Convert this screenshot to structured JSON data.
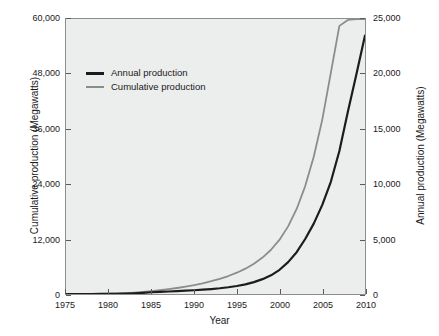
{
  "chart_data": {
    "type": "line",
    "title": "",
    "subtitle": "",
    "xlabel": "Year",
    "ylabel": "Cumulative production (Megawatts)",
    "ylabel_right": "Annual production (Megawatts)",
    "xlim": [
      1975,
      2010
    ],
    "ylim": [
      0,
      60000
    ],
    "ylim_right": [
      0,
      25000
    ],
    "grid": false,
    "legend_position": "top-left",
    "xticks": [
      "1975",
      "1980",
      "1985",
      "1990",
      "1995",
      "2000",
      "2005",
      "2010"
    ],
    "xtick_values": [
      1975,
      1980,
      1985,
      1990,
      1995,
      2000,
      2005,
      2010
    ],
    "yticks_left": [
      "0",
      "12,000",
      "24,000",
      "36,000",
      "48,000",
      "60,000"
    ],
    "ytick_left_values": [
      0,
      12000,
      24000,
      36000,
      48000,
      60000
    ],
    "yticks_right": [
      "0",
      "5,000",
      "10,000",
      "15,000",
      "20,000",
      "25,000"
    ],
    "ytick_right_values": [
      0,
      5000,
      10000,
      15000,
      20000,
      25000
    ],
    "x": [
      1975,
      1976,
      1977,
      1978,
      1979,
      1980,
      1981,
      1982,
      1983,
      1984,
      1985,
      1986,
      1987,
      1988,
      1989,
      1990,
      1991,
      1992,
      1993,
      1994,
      1995,
      1996,
      1997,
      1998,
      1999,
      2000,
      2001,
      2002,
      2003,
      2004,
      2005,
      2006,
      2007,
      2008,
      2009,
      2010
    ],
    "series": [
      {
        "name": "Annual production",
        "axis": "right",
        "color": "#1c1c1c",
        "linewidth": 2.2,
        "values": [
          0,
          0,
          0,
          0,
          5,
          10,
          20,
          40,
          70,
          110,
          160,
          200,
          230,
          260,
          300,
          340,
          390,
          450,
          520,
          610,
          730,
          880,
          1080,
          1350,
          1700,
          2200,
          2900,
          3800,
          5000,
          6400,
          8100,
          10200,
          13000,
          16600,
          20000,
          23500
        ]
      },
      {
        "name": "Cumulative production",
        "axis": "left",
        "color": "#8c8c8c",
        "linewidth": 1.8,
        "values": [
          0,
          0,
          5,
          15,
          35,
          70,
          120,
          200,
          310,
          450,
          620,
          820,
          1050,
          1310,
          1610,
          1950,
          2340,
          2790,
          3310,
          3920,
          4650,
          5530,
          6600,
          7950,
          9650,
          11850,
          14750,
          18550,
          23550,
          29950,
          38050,
          48250,
          58500,
          59800,
          59950,
          60000
        ]
      }
    ],
    "annotations": []
  },
  "legend": {
    "items": [
      {
        "label": "Annual production",
        "style": "annual"
      },
      {
        "label": "Cumulative production",
        "style": "cumulative"
      }
    ]
  },
  "colors": {
    "plot_background": "#eceded",
    "figure_background": "#ffffff",
    "axis": "#8d8d8d",
    "annual_line": "#1c1c1c",
    "cumulative_line": "#8c8c8c",
    "text": "#1a1a1a"
  }
}
